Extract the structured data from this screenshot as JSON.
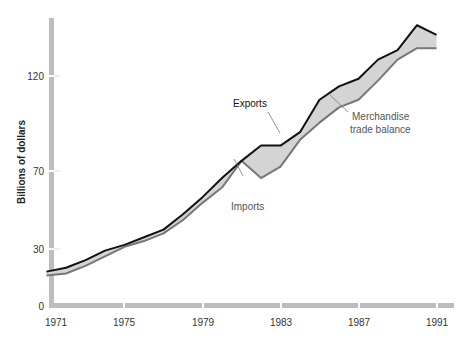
{
  "chart_data": {
    "type": "area",
    "title": "",
    "xlabel": "",
    "ylabel": "Billions of dollars",
    "x": [
      1971,
      1972,
      1973,
      1974,
      1975,
      1976,
      1977,
      1978,
      1979,
      1980,
      1981,
      1982,
      1983,
      1984,
      1985,
      1986,
      1987,
      1988,
      1989,
      1990,
      1991
    ],
    "series": [
      {
        "name": "Exports",
        "color": "#111111",
        "values": [
          18,
          20,
          24,
          29,
          32,
          36,
          40,
          48,
          57,
          67,
          76,
          84,
          84,
          91,
          108,
          115,
          119,
          129,
          134,
          147,
          142
        ]
      },
      {
        "name": "Imports",
        "color": "#777777",
        "values": [
          16,
          17,
          21,
          26,
          31,
          34,
          38,
          45,
          54,
          62,
          76,
          67,
          73,
          87,
          96,
          104,
          108,
          118,
          129,
          135,
          135
        ]
      }
    ],
    "fill_between": {
      "name": "Merchandise trade balance",
      "color": "#d4d4d4"
    },
    "x_ticks": [
      "1971",
      "1975",
      "1979",
      "1983",
      "1987",
      "1991"
    ],
    "y_ticks": [
      "0",
      "30",
      "70",
      "120"
    ],
    "ylim": [
      0,
      150
    ],
    "xlim": [
      1971,
      1991.5
    ],
    "grid": false,
    "legend": "inline annotations",
    "annotations": [
      {
        "text": "Exports",
        "target": "exports-line"
      },
      {
        "text": "Imports",
        "target": "imports-line"
      },
      {
        "text": "Merchandise",
        "target": "trade-balance-area"
      },
      {
        "text": "trade balance",
        "target": "trade-balance-area"
      }
    ]
  },
  "axis": {
    "y_title": "Billions of dollars",
    "y_ticks": {
      "t0": "0",
      "t30": "30",
      "t70": "70",
      "t120": "120"
    },
    "x_ticks": {
      "t1971": "1971",
      "t1975": "1975",
      "t1979": "1979",
      "t1983": "1983",
      "t1987": "1987",
      "t1991": "1991"
    }
  },
  "labels": {
    "exports": "Exports",
    "imports": "Imports",
    "balance_line1": "Merchandise",
    "balance_line2": "trade balance"
  },
  "colors": {
    "axis": "#bdbdbd",
    "exports": "#111111",
    "imports": "#777777",
    "fill": "#d4d4d4"
  }
}
